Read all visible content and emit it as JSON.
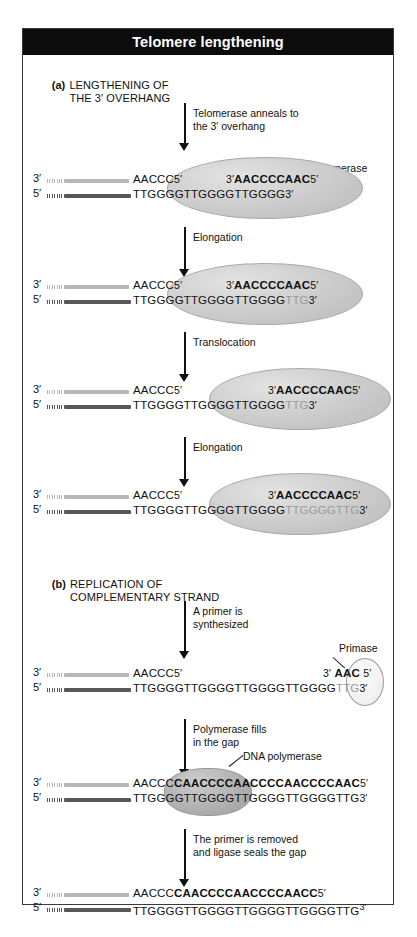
{
  "figure": {
    "title": "Telomere lengthening"
  },
  "sections": {
    "a": {
      "marker": "(a)",
      "line1": "LENGTHENING OF",
      "line2": "THE 3′ OVERHANG"
    },
    "b": {
      "marker": "(b)",
      "line1": "REPLICATION OF",
      "line2": "COMPLEMENTARY STRAND"
    }
  },
  "captions": {
    "anneal": "Telomerase anneals to\nthe 3′ overhang",
    "elongation1": "Elongation",
    "translocation": "Translocation",
    "elongation2": "Elongation",
    "primer": "A primer is\nsynthesized",
    "polymerase": "Polymerase fills\nin the gap",
    "ligase": "The primer is removed\nand ligase seals the gap"
  },
  "annotations": {
    "telomerase": "Telomerase",
    "primase": "Primase",
    "dna_polymerase": "DNA polymerase"
  },
  "ends": {
    "three_prime": "3′",
    "five_prime": "5′"
  },
  "panels": {
    "p1": {
      "top_seq": "AACCC",
      "top_end": "5′",
      "rna_left": "3′",
      "rna_seq": "AACCCCAAC",
      "rna_right": "5′",
      "bot_seq": "TTGGGGTTGGGGTTGGGG",
      "bot_end": "3′"
    },
    "p2": {
      "top_seq": "AACCC",
      "top_end": "5′",
      "rna_left": "3′",
      "rna_seq": "AACCCCAAC",
      "rna_right": "5′",
      "bot_seq": "TTGGGGTTGGGGTTGGGG",
      "bot_new": "TTG",
      "bot_end": "3′"
    },
    "p3": {
      "top_seq": "AACCC",
      "top_end": "5′",
      "rna_left": "3′",
      "rna_seq": "AACCCCAAC",
      "rna_right": "5′",
      "bot_seq": "TTGGGGTTGGGGTTGGGG",
      "bot_new": "TTG",
      "bot_end": "3′"
    },
    "p4": {
      "top_seq": "AACCC",
      "top_end": "5′",
      "rna_left": "3′",
      "rna_seq": "AACCCCAAC",
      "rna_right": "5′",
      "bot_seq": "TTGGGGTTGGGGTTGGGG",
      "bot_new": "TTGGGGTTG",
      "bot_end": "3′"
    },
    "p5": {
      "top_seq": "AACCC",
      "top_end": "5′",
      "primer_left": "3′",
      "primer_seq": "AAC",
      "primer_right": "5′",
      "bot_seq": "TTGGGGTTGGGGTTGGGGTTGGGG",
      "bot_new": "TTG",
      "bot_end": "3′"
    },
    "p6": {
      "top_seq": "AACCC",
      "top_new": "CAACCCCAACCCCAACCCCAAC",
      "top_end": "5′",
      "bot_seq": "TTGGGGTTGGGGTTGGGGTTGGGGTTG",
      "bot_end": "3′"
    },
    "p7": {
      "top_seq": "AACCC",
      "top_new": "CAACCCCAACCCCAACC",
      "top_end": "5′",
      "bot_seq": "TTGGGGTTGGGGTTGGGGTTGGGGTTG",
      "bot_end": "3′"
    }
  }
}
